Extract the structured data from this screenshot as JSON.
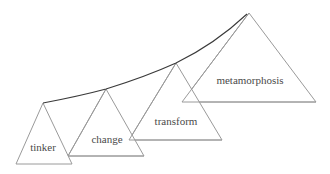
{
  "diagram": {
    "title": "",
    "colors": {
      "triangle_stroke": "#9a9a9a",
      "curve_stroke": "#3a3a3a",
      "label_text": "#4a4a4a",
      "background": "#ffffff"
    },
    "stages": [
      {
        "label": "tinker",
        "order": 1
      },
      {
        "label": "change",
        "order": 2
      },
      {
        "label": "transform",
        "order": 3
      },
      {
        "label": "metamorphosis",
        "order": 4
      }
    ],
    "connector": "curve linking the apex of each triangle, rising from tinker to metamorphosis"
  }
}
